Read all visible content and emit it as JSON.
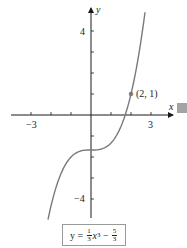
{
  "chart_data": {
    "type": "line",
    "title": "",
    "xlabel": "x",
    "ylabel": "y",
    "function": "y = (1/3)x^3 - 5/3",
    "xlim": [
      -4,
      4.2
    ],
    "ylim": [
      -5,
      5.2
    ],
    "x_ticks": [
      -3,
      -2,
      -1,
      1,
      2,
      3
    ],
    "x_tick_labels": [
      {
        "value": -3,
        "label": "−3"
      },
      {
        "value": 3,
        "label": "3"
      }
    ],
    "y_ticks": [
      -4,
      -3,
      -2,
      -1,
      1,
      2,
      3,
      4
    ],
    "y_tick_labels": [
      {
        "value": 4,
        "label": "4"
      },
      {
        "value": -4,
        "label": "−4"
      }
    ],
    "series": [
      {
        "name": "y = 1/3 x^3 − 5/3",
        "x": [
          -2.15,
          -2.0,
          -1.5,
          -1.0,
          -0.5,
          0.0,
          0.5,
          1.0,
          1.5,
          2.0,
          2.5,
          2.7
        ],
        "y": [
          -4.98,
          -4.33,
          -2.79,
          -2.0,
          -1.71,
          -1.67,
          -1.62,
          -1.33,
          -0.54,
          1.0,
          3.54,
          4.89
        ]
      }
    ],
    "annotations": [
      {
        "x": 2,
        "y": 1,
        "label": "(2, 1)"
      }
    ],
    "grid": false,
    "legend": null,
    "colors": {
      "axis": "#1a1a1a",
      "curve": "#7a7a7a",
      "point": "#7a7a7a"
    }
  },
  "labels": {
    "x_axis": "x",
    "y_axis": "y",
    "x_neg": "−3",
    "x_pos": "3",
    "y_pos": "4",
    "y_neg": "−4",
    "point": "(2, 1)"
  },
  "equation": {
    "lhs": "y =",
    "coef_num": "1",
    "coef_den": "3",
    "var": "x",
    "power": "3",
    "op": "−",
    "const_num": "5",
    "const_den": "3"
  }
}
